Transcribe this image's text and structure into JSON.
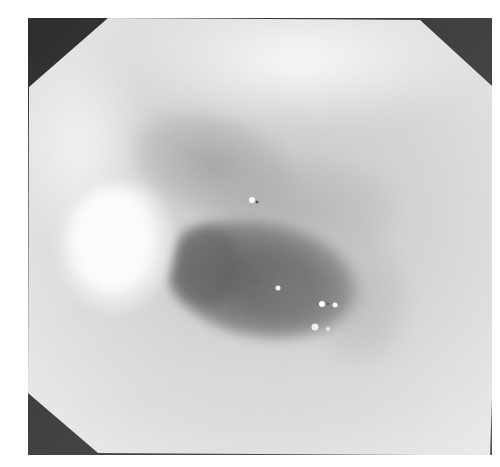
{
  "image": {
    "kind": "endoscopic-photograph",
    "colormode": "grayscale",
    "frame_shape": "octagon",
    "alt": "Grayscale endoscopic view showing a smooth rounded bulge on the left and a dark oval lumen in the center with small specular highlights",
    "colors": {
      "background": "#ffffff",
      "corner_mask": "#3a3a3a",
      "mucosa_light": "#e8e8e8",
      "mucosa_mid": "#bdbdbd",
      "lumen_dark": "#6e6e6e",
      "bulge_highlight": "#fafafa",
      "specular": "#ffffff"
    },
    "regions": {
      "frame_bounds": {
        "left": 28,
        "top": 18,
        "right": 492,
        "bottom": 455
      },
      "bulge": {
        "cx": 118,
        "cy": 252,
        "rx": 58,
        "ry": 70
      },
      "lumen": {
        "cx": 270,
        "cy": 278,
        "rx": 92,
        "ry": 52
      },
      "specular_points": [
        {
          "x": 252,
          "y": 200,
          "r": 3
        },
        {
          "x": 278,
          "y": 288,
          "r": 2.5
        },
        {
          "x": 322,
          "y": 304,
          "r": 3
        },
        {
          "x": 335,
          "y": 305,
          "r": 2.5
        },
        {
          "x": 315,
          "y": 327,
          "r": 3.5
        },
        {
          "x": 328,
          "y": 329,
          "r": 2
        }
      ]
    }
  }
}
